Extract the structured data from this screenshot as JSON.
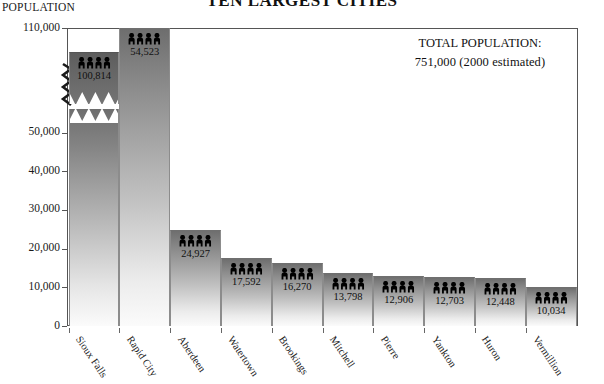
{
  "chart_data": {
    "type": "bar",
    "title": "TEN LARGEST CITIES",
    "ylabel": "POPULATION",
    "xlabel": "",
    "categories": [
      "Sioux Falls",
      "Rapid City",
      "Aberdeen",
      "Watertown",
      "Brookings",
      "Mitchell",
      "Pierre",
      "Yankton",
      "Huron",
      "Vermillion"
    ],
    "values": [
      100814,
      54523,
      24927,
      17592,
      16270,
      13798,
      12906,
      12703,
      12448,
      10034
    ],
    "value_labels": [
      "100,814",
      "54,523",
      "24,927",
      "17,592",
      "16,270",
      "13,798",
      "12,906",
      "12,703",
      "12,448",
      "10,034"
    ],
    "ylim": [
      0,
      110000
    ],
    "ytick_labels": [
      "0",
      "10,000",
      "20,000",
      "30,000",
      "40,000",
      "50,000",
      "110,000"
    ],
    "ytick_values": [
      0,
      10000,
      20000,
      30000,
      40000,
      50000,
      110000
    ],
    "axis_break": {
      "present": true,
      "between": [
        50000,
        110000
      ],
      "note": "y-axis broken between 50,000 and 110,000; Sioux Falls bar drawn with a zigzag break"
    },
    "grid": false,
    "legend": "none",
    "annotations": [
      {
        "name": "total-population-callout",
        "line1": "TOTAL POPULATION:",
        "line2": "751,000  (2000 estimated)"
      }
    ],
    "bar_style": {
      "fill": "vertical gradient dark-gray to white",
      "top_color": "#6e6e6e",
      "bottom_color": "#fbfbfb",
      "icon": "people-icon",
      "icons_per_bar": 4
    }
  },
  "axis_title": "POPULATION",
  "title": "TEN LARGEST CITIES",
  "callout": {
    "line1": "TOTAL POPULATION:",
    "line2": "751,000  (2000 estimated)"
  },
  "yticks": [
    {
      "label": "110,000",
      "value": 110000
    },
    {
      "label": "50,000",
      "value": 50000
    },
    {
      "label": "40,000",
      "value": 40000
    },
    {
      "label": "30,000",
      "value": 30000
    },
    {
      "label": "20,000",
      "value": 20000
    },
    {
      "label": "10,000",
      "value": 10000
    },
    {
      "label": "0",
      "value": 0
    }
  ],
  "bars": [
    {
      "city": "Sioux Falls",
      "value": 100814,
      "label": "100,814",
      "broken": true
    },
    {
      "city": "Rapid City",
      "value": 54523,
      "label": "54,523",
      "broken": false
    },
    {
      "city": "Aberdeen",
      "value": 24927,
      "label": "24,927",
      "broken": false
    },
    {
      "city": "Watertown",
      "value": 17592,
      "label": "17,592",
      "broken": false
    },
    {
      "city": "Brookings",
      "value": 16270,
      "label": "16,270",
      "broken": false
    },
    {
      "city": "Mitchell",
      "value": 13798,
      "label": "13,798",
      "broken": false
    },
    {
      "city": "Pierre",
      "value": 12906,
      "label": "12,906",
      "broken": false
    },
    {
      "city": "Yankton",
      "value": 12703,
      "label": "12,703",
      "broken": false
    },
    {
      "city": "Huron",
      "value": 12448,
      "label": "12,448",
      "broken": false
    },
    {
      "city": "Vermillion",
      "value": 10034,
      "label": "10,034",
      "broken": false
    }
  ],
  "icons": {
    "bar_icon_name": "people-icon",
    "people_per_group": 4
  },
  "colors": {
    "bar_top": "#6e6e6e",
    "bar_bottom": "#fbfbfb",
    "cap_fill": "#6a6a6a",
    "axis": "#555555",
    "text": "#111111",
    "background": "#ffffff"
  }
}
